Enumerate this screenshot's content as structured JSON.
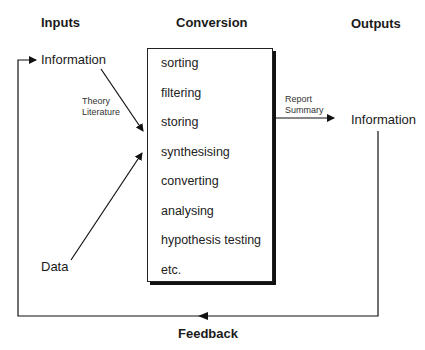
{
  "headings": {
    "inputs": "Inputs",
    "conversion": "Conversion",
    "outputs": "Outputs"
  },
  "inputs": {
    "information": "Information",
    "data": "Data",
    "arrow_label_line1": "Theory",
    "arrow_label_line2": "Literature"
  },
  "conversion_steps": [
    "sorting",
    "filtering",
    "storing",
    "synthesising",
    "converting",
    "analysing",
    "hypothesis testing",
    "etc."
  ],
  "outputs": {
    "information": "Information",
    "arrow_label_line1": "Report",
    "arrow_label_line2": "Summary"
  },
  "feedback": {
    "label": "Feedback"
  }
}
